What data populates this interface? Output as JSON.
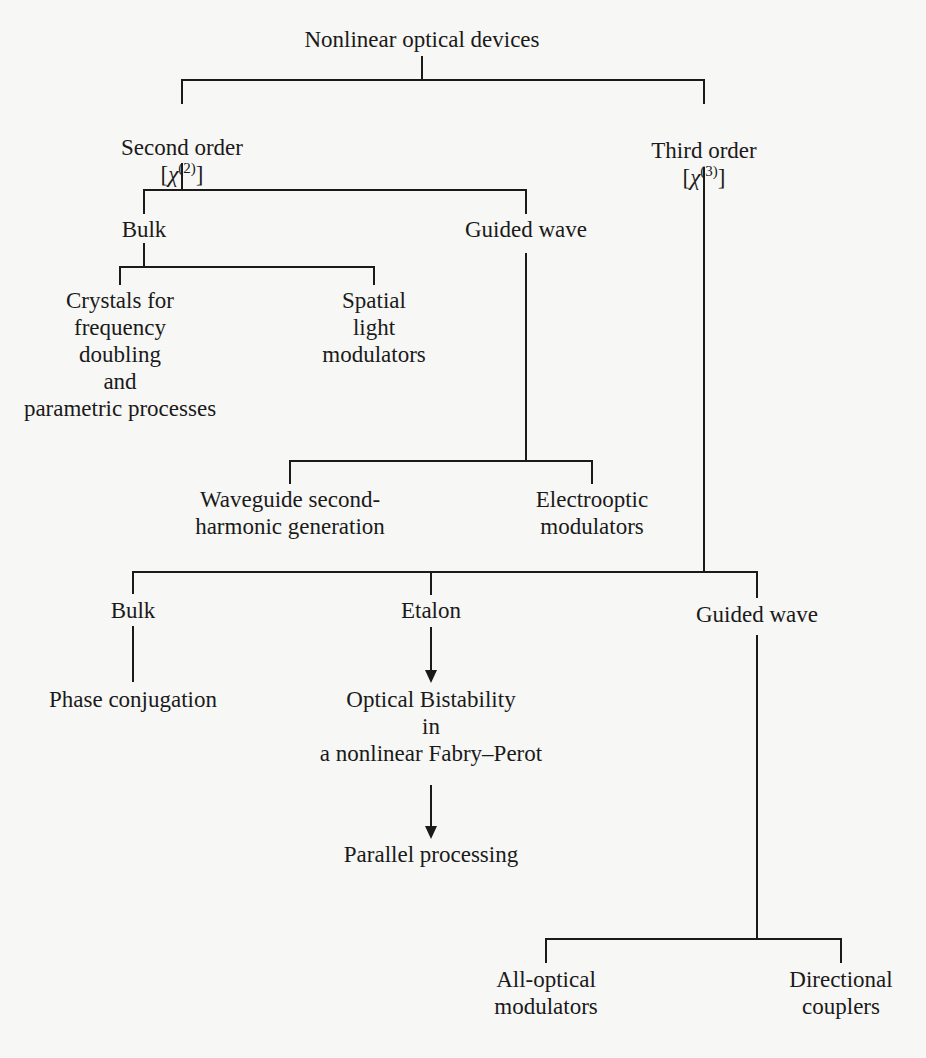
{
  "diagram": {
    "title": "Nonlinear optical devices",
    "nodes": {
      "root": {
        "label": "Nonlinear optical devices"
      },
      "second_order": {
        "label": "Second order",
        "chi_symbol": "χ",
        "chi_order": "(2)"
      },
      "third_order": {
        "label": "Third order",
        "chi_symbol": "χ",
        "chi_order": "(3)"
      },
      "so_bulk": {
        "label": "Bulk"
      },
      "so_guided": {
        "label": "Guided wave"
      },
      "crystals": {
        "label": "Crystals for\nfrequency\ndoubling\nand\nparametric processes"
      },
      "slm": {
        "label": "Spatial\nlight\nmodulators"
      },
      "wg_shg": {
        "label": "Waveguide second-\nharmonic generation"
      },
      "eo_mod": {
        "label": "Electrooptic\nmodulators"
      },
      "to_bulk": {
        "label": "Bulk"
      },
      "etalon": {
        "label": "Etalon"
      },
      "to_guided": {
        "label": "Guided wave"
      },
      "phase_conj": {
        "label": "Phase conjugation"
      },
      "bistability": {
        "label": "Optical Bistability\nin\na nonlinear Fabry–Perot"
      },
      "parallel": {
        "label": "Parallel processing"
      },
      "ao_mod": {
        "label": "All-optical\nmodulators"
      },
      "dir_couplers": {
        "label": "Directional\ncouplers"
      }
    },
    "edges": [
      [
        "root",
        "second_order"
      ],
      [
        "root",
        "third_order"
      ],
      [
        "second_order",
        "so_bulk"
      ],
      [
        "second_order",
        "so_guided"
      ],
      [
        "so_bulk",
        "crystals"
      ],
      [
        "so_bulk",
        "slm"
      ],
      [
        "so_guided",
        "wg_shg"
      ],
      [
        "so_guided",
        "eo_mod"
      ],
      [
        "third_order",
        "to_bulk"
      ],
      [
        "third_order",
        "etalon"
      ],
      [
        "third_order",
        "to_guided"
      ],
      [
        "to_bulk",
        "phase_conj"
      ],
      [
        "etalon",
        "bistability"
      ],
      [
        "bistability",
        "parallel"
      ],
      [
        "to_guided",
        "ao_mod"
      ],
      [
        "to_guided",
        "dir_couplers"
      ]
    ],
    "arrow_edges": [
      [
        "etalon",
        "bistability"
      ],
      [
        "bistability",
        "parallel"
      ]
    ]
  }
}
